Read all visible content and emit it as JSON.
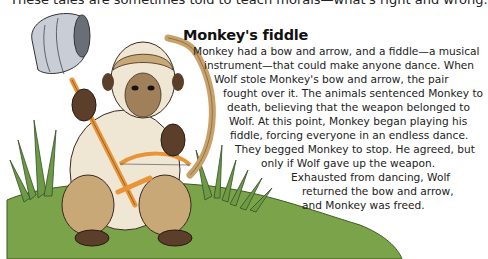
{
  "intro_line": "These tales are sometimes told to teach morals—what's right and wrong.",
  "story": {
    "title": "Monkey's fiddle",
    "lines": [
      "Monkey had a bow and arrow, and a fiddle—a musical",
      "instrument—that could make anyone dance. When",
      "Wolf stole Monkey's bow and arrow, the pair",
      "fought over it. The animals sentenced Monkey to",
      "death, believing that the weapon belonged to",
      "Wolf. At this point, Monkey began playing his",
      "fiddle, forcing everyone in an endless dance.",
      "They begged Monkey to stop. He agreed, but",
      "only if Wolf gave up the weapon.",
      "Exhausted from dancing, Wolf",
      "returned the bow and arrow,",
      "and Monkey was freed."
    ]
  },
  "illustration": {
    "subject": "monkey-holding-fiddle-and-bow",
    "colors": {
      "grass": "#7aa34a",
      "fur_light": "#efe6d4",
      "fur_tan": "#c9a878",
      "fur_dark": "#5b3f2a",
      "tail": "#c8a26a",
      "fiddle_wood": "#e8953a",
      "bucket": "#c9ced6"
    }
  }
}
